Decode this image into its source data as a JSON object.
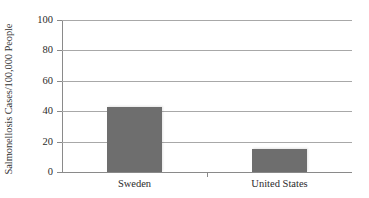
{
  "chart_data": {
    "type": "bar",
    "title": "",
    "subtitle": "",
    "categories": [
      "Sweden",
      "United States"
    ],
    "values": [
      42.5,
      15
    ],
    "series": [
      {
        "name": "Salmonellosis Cases/100,000 People",
        "values": [
          42.5,
          15
        ]
      }
    ],
    "xlabel": "",
    "ylabel": "Salmonellosis Cases/100,000 People",
    "ylim": [
      0,
      100
    ],
    "yticks": [
      0,
      20,
      40,
      60,
      80,
      100
    ],
    "ytick_labels": [
      "0",
      "20",
      "40",
      "60",
      "80",
      "100"
    ],
    "grid": true,
    "legend": false,
    "legend_position": "none",
    "bar_color": "#6e6e6e",
    "grid_color": "#a8a8a8",
    "axis_color": "#8a8a8a",
    "background_color": "#ffffff"
  }
}
